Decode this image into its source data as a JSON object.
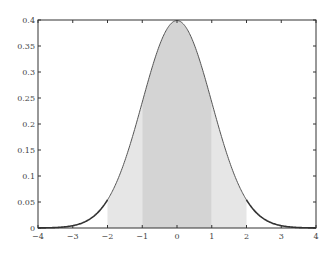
{
  "chart_data": {
    "type": "area",
    "title": "",
    "xlabel": "",
    "ylabel": "",
    "xlim": [
      -4,
      4
    ],
    "ylim": [
      0,
      0.4
    ],
    "grid": false,
    "legend": null,
    "xticks": [
      "−4",
      "−3",
      "−2",
      "−1",
      "0",
      "1",
      "2",
      "3",
      "4"
    ],
    "xtick_values": [
      -4,
      -3,
      -2,
      -1,
      0,
      1,
      2,
      3,
      4
    ],
    "yticks": [
      "0",
      "0.05",
      "0.1",
      "0.15",
      "0.2",
      "0.25",
      "0.3",
      "0.35",
      "0.4"
    ],
    "ytick_values": [
      0,
      0.05,
      0.1,
      0.15,
      0.2,
      0.25,
      0.3,
      0.35,
      0.4
    ],
    "series": [
      {
        "name": "standard normal pdf",
        "function": "exp(-x^2/2)/sqrt(2*pi)",
        "mean": 0,
        "sd": 1,
        "x": [
          -4,
          -3,
          -2,
          -1,
          0,
          1,
          2,
          3,
          4
        ],
        "values": [
          0.0001,
          0.0044,
          0.054,
          0.242,
          0.399,
          0.242,
          0.054,
          0.0044,
          0.0001
        ]
      }
    ],
    "shaded_regions": [
      {
        "from": -2,
        "to": -1,
        "color": "#e6e6e6"
      },
      {
        "from": -1,
        "to": 1,
        "color": "#d4d4d4"
      },
      {
        "from": 1,
        "to": 2,
        "color": "#e6e6e6"
      }
    ]
  },
  "colors": {
    "curve": "#555555",
    "axis": "#333333",
    "inner": "#d4d4d4",
    "outer": "#e6e6e6"
  }
}
